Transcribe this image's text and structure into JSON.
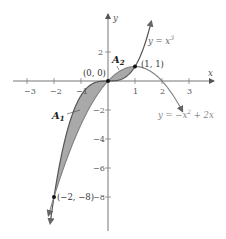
{
  "chart_data": {
    "type": "line",
    "title": "",
    "xlabel": "x",
    "ylabel": "y",
    "xlim": [
      -3.5,
      3.6
    ],
    "ylim": [
      -10.3,
      4.5
    ],
    "grid": false,
    "x_ticks": [
      -3,
      -2,
      -1,
      1,
      2,
      3
    ],
    "x_tick_labels": [
      "−3",
      "−2",
      "−1",
      "1",
      "2",
      "3"
    ],
    "y_ticks": [
      2,
      -2,
      -4,
      -6,
      -8
    ],
    "y_tick_labels": [
      "2",
      "−2",
      "−4",
      "−6",
      "−8"
    ],
    "series": [
      {
        "name": "y = x^3",
        "label_text": "y = x",
        "label_sup": "3",
        "formula": "x^3",
        "x_range": [
          -2.15,
          1.6
        ],
        "color": "#555555"
      },
      {
        "name": "y = -x^2 + 2x",
        "label_text": "y = −x",
        "label_sup": "2",
        "label_tail": " + 2x",
        "formula": "-x^2+2x",
        "x_range": [
          -2.1,
          2.75
        ],
        "color": "#777777"
      }
    ],
    "shaded_regions": [
      {
        "name": "A1",
        "label": "A",
        "sub": "1",
        "x_range": [
          -2,
          0
        ],
        "between": [
          "y = x^3",
          "y = -x^2 + 2x"
        ],
        "fill": "#a9a9a9"
      },
      {
        "name": "A2",
        "label": "A",
        "sub": "2",
        "x_range": [
          0,
          1
        ],
        "between": [
          "y = x^3",
          "y = -x^2 + 2x"
        ],
        "fill": "#a9a9a9"
      }
    ],
    "points": [
      {
        "x": 0,
        "y": 0,
        "label": "(0, 0)"
      },
      {
        "x": 1,
        "y": 1,
        "label": "(1, 1)"
      },
      {
        "x": -2,
        "y": -8,
        "label": "(−2, −8)"
      }
    ],
    "legend": null
  },
  "labels": {
    "x_axis": "x",
    "y_axis": "y",
    "origin_point": "(0, 0)",
    "point_1_1": "(1, 1)",
    "point_m2_m8": "(−2, −8)",
    "cubic_eq": "y = x",
    "cubic_sup": "3",
    "parabola_eq": "y = −x",
    "parabola_sup": "2",
    "parabola_tail": " + 2x",
    "area1": "A",
    "area1_sub": "1",
    "area2": "A",
    "area2_sub": "2",
    "tick_x_m3": "−3",
    "tick_x_m2": "−2",
    "tick_x_m1": "−1",
    "tick_x_1": "1",
    "tick_x_2": "2",
    "tick_x_3": "3",
    "tick_y_2": "2",
    "tick_y_m2": "−2",
    "tick_y_m4": "−4",
    "tick_y_m6": "−6",
    "tick_y_m8": "−8"
  },
  "colors": {
    "axis": "#666666",
    "cubic": "#555555",
    "parabola": "#808080",
    "shade": "#a9a9a9",
    "eq_label": "#888888"
  }
}
